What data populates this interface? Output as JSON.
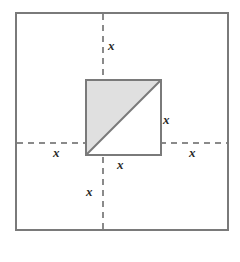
{
  "figure": {
    "canvas": {
      "width": 240,
      "height": 262,
      "background": "#ffffff"
    },
    "outer_square": {
      "name": "outer-square",
      "x": 15,
      "y": 12,
      "size": 214,
      "stroke": "#7a7a7a",
      "stroke_width": 2,
      "fill": "#ffffff"
    },
    "inner_square": {
      "name": "inner-square",
      "x": 86,
      "y": 80,
      "size": 75,
      "stroke": "#7a7a7a",
      "stroke_width": 2,
      "fill": "#ffffff"
    },
    "shaded_triangle": {
      "name": "shaded-triangle",
      "points": "86,80 161,80 86,155",
      "fill": "#e0e0e0",
      "stroke": "#7a7a7a",
      "stroke_width": 2,
      "description": "upper-left half of the inner square, shaded"
    },
    "diagonal": {
      "name": "diagonal-line",
      "x1": 86,
      "y1": 155,
      "x2": 161,
      "y2": 80,
      "stroke": "#7a7a7a",
      "stroke_width": 2
    },
    "dashed_lines": [
      {
        "name": "vertical-dashed-axis",
        "orientation": "vertical",
        "x": 103,
        "y1": 14,
        "y2": 229,
        "stroke": "#8a8a8a",
        "stroke_width": 2,
        "dash": "6 5"
      },
      {
        "name": "horizontal-dashed-axis",
        "orientation": "horizontal",
        "y": 143,
        "x1": 17,
        "x2": 227,
        "stroke": "#8a8a8a",
        "stroke_width": 2,
        "dash": "6 5"
      }
    ],
    "labels": [
      {
        "name": "label-x-top",
        "text": "x",
        "x": 108,
        "y": 39
      },
      {
        "name": "label-x-right-side",
        "text": "x",
        "x": 163,
        "y": 113
      },
      {
        "name": "label-x-left-outer",
        "text": "x",
        "x": 53,
        "y": 146
      },
      {
        "name": "label-x-right-outer",
        "text": "x",
        "x": 189,
        "y": 146
      },
      {
        "name": "label-x-bottom-edge",
        "text": "x",
        "x": 117,
        "y": 158
      },
      {
        "name": "label-x-bottom",
        "text": "x",
        "x": 86,
        "y": 185
      }
    ]
  }
}
